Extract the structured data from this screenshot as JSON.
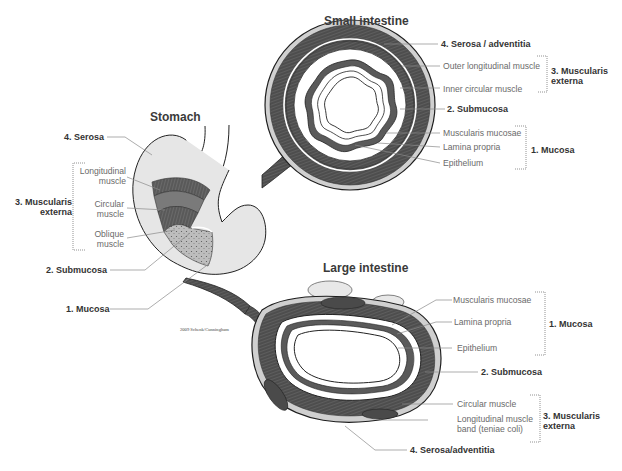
{
  "figure": {
    "credit": "2009 Schenk/Cunningham",
    "colors": {
      "background": "#ffffff",
      "muscle": "#5a5a5a",
      "muscle_dark": "#3c3c3c",
      "serosa": "#d2d2d2",
      "outline": "#1e1e1e",
      "label_gray": "#6a6a6a",
      "label_bold": "#333333",
      "leader": "#8a8a8a"
    }
  },
  "stomach": {
    "title": "Stomach",
    "labels": {
      "serosa": "4. Serosa",
      "longitudinal_1": "Longitudinal",
      "longitudinal_2": "muscle",
      "circular_1": "Circular",
      "circular_2": "muscle",
      "oblique_1": "Oblique",
      "oblique_2": "muscle",
      "muscularis_1": "3. Muscularis",
      "muscularis_2": "externa",
      "submucosa": "2. Submucosa",
      "mucosa": "1. Mucosa"
    }
  },
  "small_intestine": {
    "title": "Small intestine",
    "labels": {
      "serosa": "4. Serosa / adventitia",
      "outer_longitudinal": "Outer longitudinal muscle",
      "inner_circular": "Inner circular muscle",
      "muscularis_1": "3. Muscularis",
      "muscularis_2": "externa",
      "submucosa": "2. Submucosa",
      "muscularis_mucosae": "Muscularis mucosae",
      "lamina_propria": "Lamina propria",
      "epithelium": "Epithelium",
      "mucosa": "1. Mucosa"
    }
  },
  "large_intestine": {
    "title": "Large intestine",
    "labels": {
      "muscularis_mucosae": "Muscularis mucosae",
      "lamina_propria": "Lamina propria",
      "epithelium": "Epithelium",
      "mucosa": "1. Mucosa",
      "submucosa": "2. Submucosa",
      "circular_muscle": "Circular muscle",
      "longitudinal_band_1": "Longitudinal muscle",
      "longitudinal_band_2": "band (teniae coli)",
      "muscularis_1": "3. Muscularis",
      "muscularis_2": "externa",
      "serosa": "4. Serosa/adventitia"
    }
  }
}
